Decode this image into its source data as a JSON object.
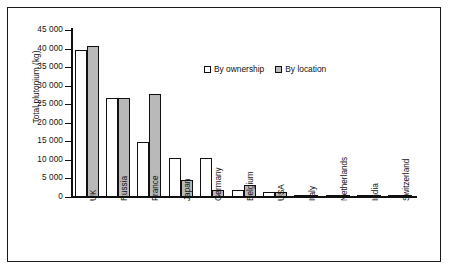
{
  "chart_data": {
    "type": "bar",
    "title": "",
    "xlabel": "",
    "ylabel": "Total plutonium (kg)",
    "ylim": [
      0,
      45000
    ],
    "ytick_step": 5000,
    "grid": false,
    "legend_position": "top-center",
    "categories": [
      "UK",
      "Russia",
      "France",
      "Japan",
      "Germany",
      "Belgium",
      "USA",
      "Italy",
      "Netherlands",
      "India",
      "Switzerland"
    ],
    "ytick_labels": [
      "45 000",
      "40 000",
      "35 000",
      "30 000",
      "25 000",
      "20 000",
      "15 000",
      "10 000",
      "5 000",
      "0"
    ],
    "ytick_values": [
      45000,
      40000,
      35000,
      30000,
      25000,
      20000,
      15000,
      10000,
      5000,
      0
    ],
    "series": [
      {
        "name": "By ownership",
        "color": "#ffffff",
        "values": [
          39500,
          26700,
          14800,
          10600,
          10600,
          1800,
          1400,
          400,
          400,
          500,
          300
        ]
      },
      {
        "name": "By location",
        "color": "#b9b9b9",
        "values": [
          40800,
          26700,
          27700,
          4700,
          1800,
          3300,
          1400,
          300,
          400,
          600,
          200
        ]
      }
    ]
  },
  "legend": {
    "items": [
      {
        "label": "By ownership",
        "swatch": "ownership"
      },
      {
        "label": "By location",
        "swatch": "location"
      }
    ]
  }
}
